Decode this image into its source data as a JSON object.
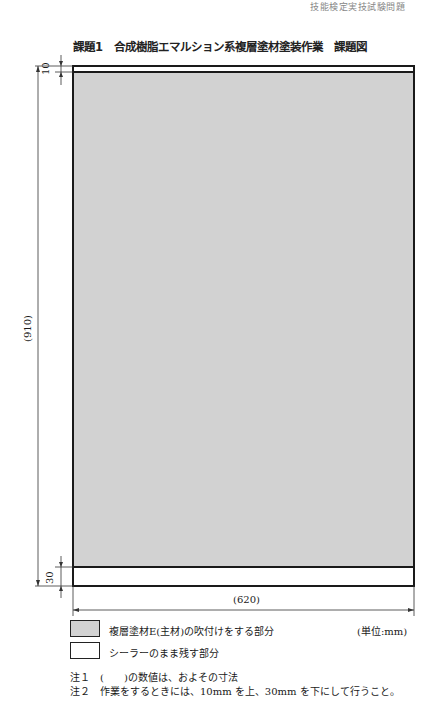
{
  "header": {
    "cut_off_text": "技能検定実技試験問題"
  },
  "title": "課題1　合成樹脂エマルション系複層塗材塗装作業　課題図",
  "drawing": {
    "dimensions": {
      "top_band": "10",
      "height": "(910)",
      "bottom_band": "30",
      "width": "(620)"
    },
    "colors": {
      "sprayed_area": "#d2d2d2",
      "sealer_area": "#ffffff",
      "line": "#1a1a1a"
    }
  },
  "legend": {
    "items": [
      {
        "label": "複層塗材E(主材)の吹付けをする部分",
        "swatch": "gray"
      },
      {
        "label": "シーラーのまま残す部分",
        "swatch": "white"
      }
    ],
    "unit": "(単位:mm)"
  },
  "notes": [
    "注１　(　　)の数値は、およその寸法",
    "注２　作業をするときには、10mm を上、30mm を下にして行うこと。"
  ]
}
